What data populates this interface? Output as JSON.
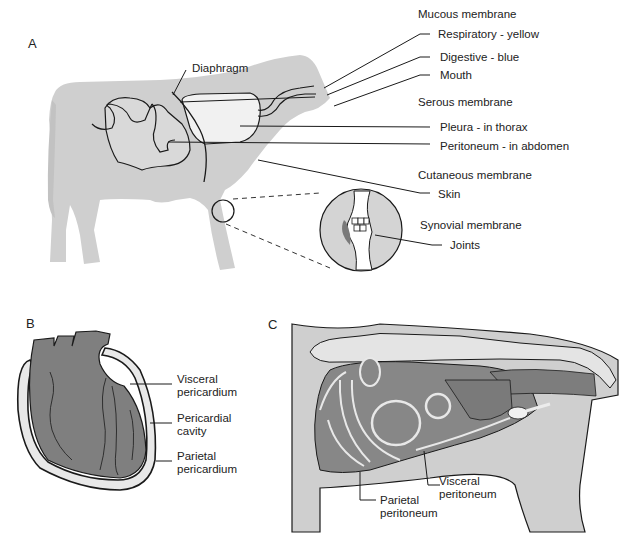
{
  "panels": {
    "a": {
      "letter": "A",
      "diaphragm": "Diaphragm",
      "groups": [
        {
          "heading": "Mucous membrane",
          "items": [
            "Respiratory - yellow",
            "Digestive - blue",
            "Mouth"
          ]
        },
        {
          "heading": "Serous membrane",
          "items": [
            "Pleura - in thorax",
            "Peritoneum - in abdomen"
          ]
        },
        {
          "heading": "Cutaneous membrane",
          "items": [
            "Skin"
          ]
        },
        {
          "heading": "Synovial membrane",
          "items": [
            "Joints"
          ]
        }
      ]
    },
    "b": {
      "letter": "B",
      "labels": [
        {
          "line1": "Visceral",
          "line2": "pericardium"
        },
        {
          "line1": "Pericardial",
          "line2": "cavity"
        },
        {
          "line1": "Parietal",
          "line2": "pericardium"
        }
      ]
    },
    "c": {
      "letter": "C",
      "labels": [
        {
          "line1": "Visceral",
          "line2": "peritoneum"
        },
        {
          "line1": "Parietal",
          "line2": "peritoneum"
        }
      ]
    }
  },
  "colors": {
    "body_fill": "#cfcfcf",
    "organ_fill": "#808080",
    "light_fill": "#ebebeb",
    "outline": "#1a1a1a"
  }
}
